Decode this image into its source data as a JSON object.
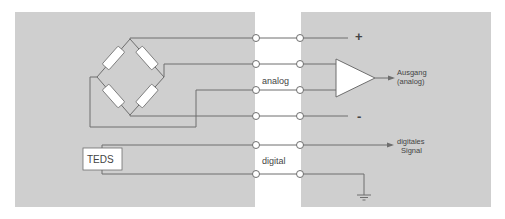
{
  "colors": {
    "panel": "#cfcfcf",
    "background": "#ffffff",
    "line": "#6e6e6e",
    "component_fill": "#ffffff"
  },
  "labels": {
    "plus": "+",
    "minus": "-",
    "analog": "analog",
    "digital": "digital",
    "output_line1": "Ausgang",
    "output_line2": "(analog)",
    "digital_signal_line1": "digitales",
    "digital_signal_line2": "Signal",
    "teds": "TEDS"
  },
  "components": {
    "bridge": "wheatstone-bridge",
    "amplifier": "differential-amplifier",
    "teds_chip": "TEDS",
    "ground": "ground-symbol"
  },
  "connectors": {
    "analog_rows": 4,
    "digital_rows": 2
  }
}
